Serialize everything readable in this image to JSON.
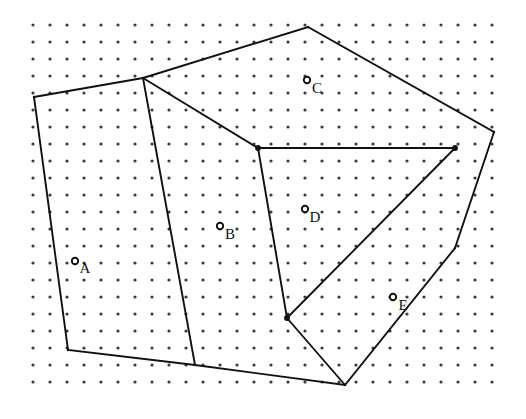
{
  "figure": {
    "type": "geometric-diagram",
    "width": 526,
    "height": 419,
    "background_color": "#ffffff",
    "line_color": "#111111",
    "dot_color": "#3a3a3a",
    "marker_fill_color": "#ffffff"
  },
  "lattice": {
    "name": "dot-grid",
    "spacing_px": 17,
    "origin_x": 33,
    "origin_y": 25,
    "columns": 28,
    "rows": 22,
    "dot_radius": 1.6
  },
  "outer_polygon": {
    "name": "convex-hull",
    "closed": true,
    "vertices": [
      {
        "id": "h1",
        "x": 34,
        "y": 97
      },
      {
        "id": "h2",
        "x": 143,
        "y": 78
      },
      {
        "id": "h3",
        "x": 308,
        "y": 27
      },
      {
        "id": "h4",
        "x": 494,
        "y": 132
      },
      {
        "id": "h5",
        "x": 455,
        "y": 248
      },
      {
        "id": "h6",
        "x": 345,
        "y": 385
      },
      {
        "id": "h7",
        "x": 195,
        "y": 365
      },
      {
        "id": "h8",
        "x": 68,
        "y": 350
      }
    ]
  },
  "internal_nodes": [
    {
      "id": "n1",
      "x": 258,
      "y": 148
    },
    {
      "id": "n2",
      "x": 455,
      "y": 148
    },
    {
      "id": "n3",
      "x": 287,
      "y": 318
    }
  ],
  "internal_edges": [
    {
      "name": "edge-h2-n1",
      "x1": 143,
      "y1": 78,
      "x2": 258,
      "y2": 148
    },
    {
      "name": "edge-h2-h7",
      "x1": 143,
      "y1": 78,
      "x2": 195,
      "y2": 365
    },
    {
      "name": "edge-n1-n2",
      "x1": 258,
      "y1": 148,
      "x2": 455,
      "y2": 148
    },
    {
      "name": "edge-n1-n3",
      "x1": 258,
      "y1": 148,
      "x2": 287,
      "y2": 318
    },
    {
      "name": "edge-n3-n2",
      "x1": 287,
      "y1": 318,
      "x2": 455,
      "y2": 148
    },
    {
      "name": "edge-n3-h6",
      "x1": 287,
      "y1": 318,
      "x2": 345,
      "y2": 385
    }
  ],
  "sites": [
    {
      "id": "site-a",
      "label": "A",
      "x": 75,
      "y": 261,
      "label_x": 85,
      "label_y": 270,
      "radius": 3.2
    },
    {
      "id": "site-b",
      "label": "B",
      "x": 220,
      "y": 226,
      "label_x": 230,
      "label_y": 236,
      "radius": 3.2
    },
    {
      "id": "site-c",
      "label": "C",
      "x": 307,
      "y": 80,
      "label_x": 317,
      "label_y": 90,
      "radius": 3.2
    },
    {
      "id": "site-d",
      "label": "D",
      "x": 305,
      "y": 209,
      "label_x": 315,
      "label_y": 219,
      "radius": 3.2
    },
    {
      "id": "site-e",
      "label": "E",
      "x": 393,
      "y": 297,
      "label_x": 403,
      "label_y": 307,
      "radius": 3.2
    }
  ]
}
